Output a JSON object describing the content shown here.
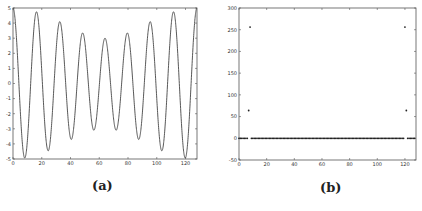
{
  "figure": {
    "captions": [
      "(a)",
      "(b)"
    ]
  },
  "chart_data": [
    {
      "type": "line",
      "title": "",
      "caption": "(a)",
      "xlabel": "",
      "ylabel": "",
      "xlim": [
        0,
        128
      ],
      "ylim": [
        -5,
        5
      ],
      "xticks": [
        0,
        20,
        40,
        60,
        80,
        100,
        120
      ],
      "yticks": [
        -5,
        -4,
        -3,
        -2,
        -1,
        0,
        1,
        2,
        3,
        4,
        5
      ],
      "grid": false,
      "series": [
        {
          "name": "x(n) = 4cos(2π·8n/128) + cos(2π·7n/128)",
          "formula": {
            "components": [
              {
                "amp": 4,
                "freq_bin": 8
              },
              {
                "amp": 1,
                "freq_bin": 7
              }
            ],
            "N": 128
          }
        }
      ],
      "peaks_approx": [
        5.0,
        3.0,
        4.5,
        3.9,
        3.3,
        4.7,
        2.9,
        4.7,
        3.3,
        3.9,
        4.5,
        3.0
      ]
    },
    {
      "type": "scatter",
      "title": "",
      "caption": "(b)",
      "xlabel": "",
      "ylabel": "",
      "xlim": [
        0,
        128
      ],
      "ylim": [
        -50,
        300
      ],
      "xticks": [
        0,
        20,
        40,
        60,
        80,
        100,
        120
      ],
      "yticks": [
        -50,
        0,
        50,
        100,
        150,
        200,
        250,
        300
      ],
      "grid": false,
      "points": [
        {
          "x": 7,
          "y": 64
        },
        {
          "x": 8,
          "y": 256
        },
        {
          "x": 120,
          "y": 256
        },
        {
          "x": 121,
          "y": 64
        }
      ],
      "baseline": {
        "y": 0,
        "x_range": [
          0,
          127
        ],
        "note": "all other bins ≈ 0"
      }
    }
  ]
}
